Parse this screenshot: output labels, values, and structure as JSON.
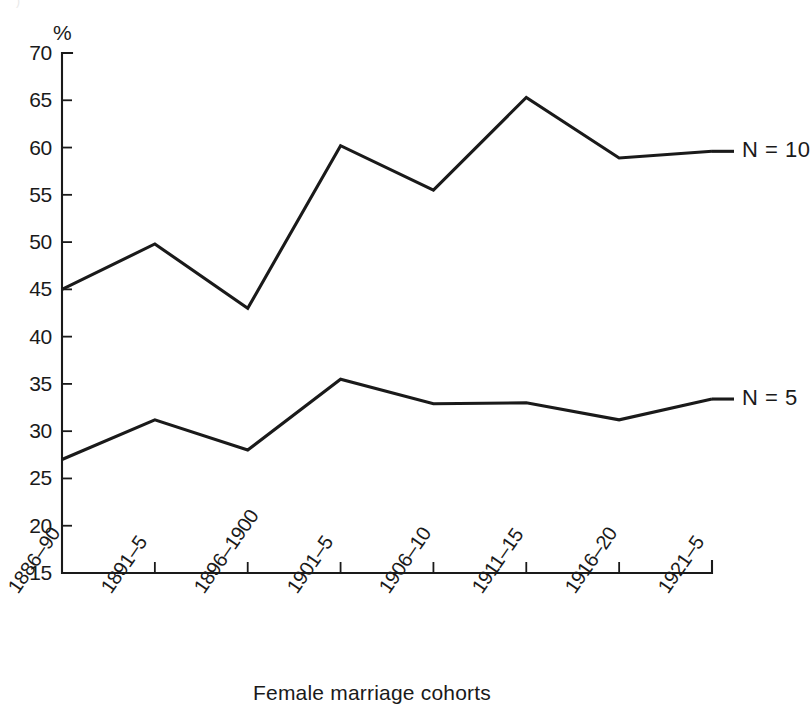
{
  "figure": {
    "ghost_header_text": "",
    "y_axis_unit_symbol": "%",
    "x_axis_title": "Female marriage cohorts"
  },
  "chart_data": {
    "type": "line",
    "title": "",
    "subtitle": "",
    "xlabel": "Female marriage cohorts",
    "ylabel": "%",
    "ylim": [
      15,
      70
    ],
    "ytick_step": 5,
    "yticks": [
      15,
      20,
      25,
      30,
      35,
      40,
      45,
      50,
      55,
      60,
      65,
      70
    ],
    "ytick_labels": [
      "15",
      "20",
      "25",
      "30",
      "35",
      "40",
      "45",
      "50",
      "55",
      "60",
      "65",
      "70"
    ],
    "grid": false,
    "legend_position": "right-inline",
    "categories": [
      "1886–90",
      "1891–5",
      "1896–1900",
      "1901–5",
      "1906–10",
      "1911–15",
      "1916–20",
      "1921–5"
    ],
    "series": [
      {
        "name": "N = 10",
        "label": "N = 10",
        "values": [
          45.0,
          49.8,
          43.0,
          60.2,
          55.5,
          65.3,
          58.9,
          59.6
        ]
      },
      {
        "name": "N = 5",
        "label": "N = 5",
        "values": [
          27.0,
          31.2,
          28.0,
          35.5,
          32.9,
          33.0,
          31.2,
          33.4
        ]
      }
    ],
    "annotations": [
      {
        "text": "N = 10",
        "attached_to_series": "N = 10",
        "at_category": "1921–5"
      },
      {
        "text": "N = 5",
        "attached_to_series": "N = 5",
        "at_category": "1921–5"
      }
    ]
  }
}
